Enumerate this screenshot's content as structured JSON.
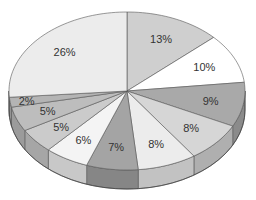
{
  "chart_data": {
    "type": "pie",
    "style": "3d",
    "title": "",
    "categories": [
      "A",
      "B",
      "C",
      "D",
      "E",
      "F",
      "G",
      "H",
      "I",
      "J",
      "K"
    ],
    "values": [
      13,
      10,
      9,
      8,
      8,
      7,
      6,
      5,
      5,
      2,
      26
    ],
    "labels": [
      "13%",
      "10%",
      "9%",
      "8%",
      "8%",
      "7%",
      "6%",
      "5%",
      "5%",
      "2%",
      "26%"
    ],
    "colors": [
      "#cfcfcf",
      "#ffffff",
      "#a9a9a9",
      "#d6d6d6",
      "#ececec",
      "#a4a4a4",
      "#f4f4f4",
      "#cbcbcb",
      "#bdbdbd",
      "#b4b4b4",
      "#ececec"
    ],
    "start_angle_deg": 0,
    "direction": "clockwise",
    "legend": "none"
  }
}
